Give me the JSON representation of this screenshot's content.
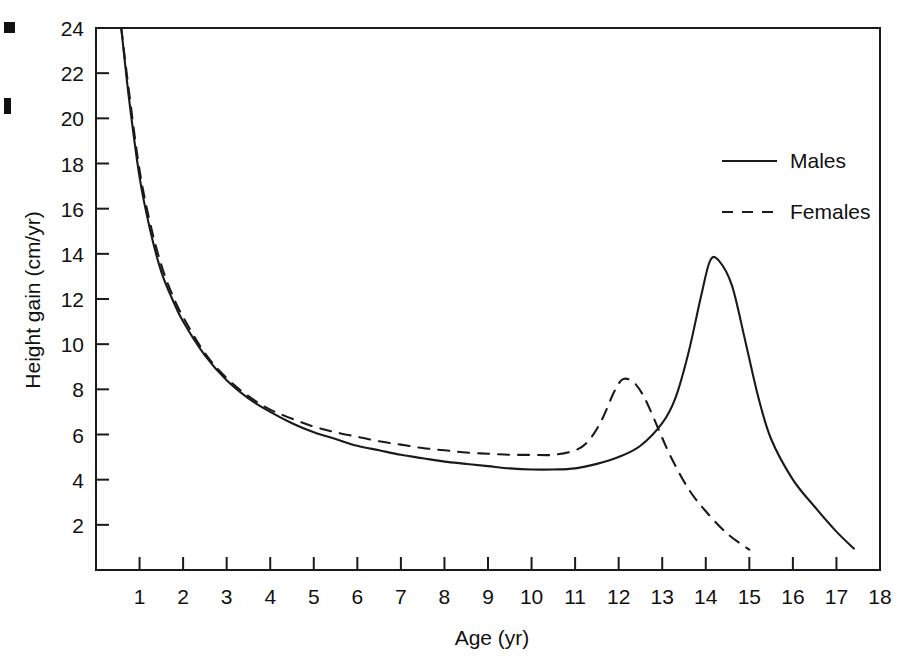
{
  "chart_data": {
    "type": "line",
    "title": "",
    "xlabel": "Age (yr)",
    "ylabel": "Height gain (cm/yr)",
    "xlim": [
      0,
      18
    ],
    "ylim": [
      0,
      24
    ],
    "grid": false,
    "legend_position": "top-right",
    "x_ticks": [
      "1",
      "2",
      "3",
      "4",
      "5",
      "6",
      "7",
      "8",
      "9",
      "10",
      "11",
      "12",
      "13",
      "14",
      "15",
      "16",
      "17",
      "18"
    ],
    "x_tick_values": [
      1,
      2,
      3,
      4,
      5,
      6,
      7,
      8,
      9,
      10,
      11,
      12,
      13,
      14,
      15,
      16,
      17,
      18
    ],
    "y_ticks": [
      "2",
      "4",
      "6",
      "8",
      "10",
      "12",
      "14",
      "16",
      "18",
      "20",
      "22",
      "24"
    ],
    "y_tick_values": [
      2,
      4,
      6,
      8,
      10,
      12,
      14,
      16,
      18,
      20,
      22,
      24
    ],
    "series": [
      {
        "name": "Males",
        "style": "solid",
        "color": "#1a1a1a",
        "x": [
          0.58,
          0.75,
          1.0,
          1.25,
          1.5,
          1.75,
          2.0,
          2.5,
          3.0,
          3.5,
          4.0,
          4.5,
          5.0,
          5.5,
          6.0,
          6.5,
          7.0,
          7.5,
          8.0,
          8.5,
          9.0,
          9.5,
          10.0,
          10.5,
          11.0,
          11.5,
          12.0,
          12.5,
          13.0,
          13.3,
          13.6,
          13.9,
          14.1,
          14.3,
          14.6,
          14.9,
          15.2,
          15.5,
          16.0,
          16.5,
          17.0,
          17.4
        ],
        "y": [
          24.0,
          21.0,
          17.4,
          15.0,
          13.2,
          12.0,
          11.0,
          9.5,
          8.4,
          7.6,
          7.0,
          6.5,
          6.1,
          5.8,
          5.5,
          5.3,
          5.1,
          4.95,
          4.8,
          4.7,
          4.6,
          4.5,
          4.45,
          4.45,
          4.5,
          4.7,
          5.0,
          5.5,
          6.5,
          7.6,
          9.6,
          12.2,
          13.7,
          13.7,
          12.6,
          10.2,
          7.7,
          5.8,
          4.0,
          2.8,
          1.7,
          0.95
        ]
      },
      {
        "name": "Females",
        "style": "dashed",
        "color": "#1a1a1a",
        "x": [
          0.58,
          0.75,
          1.0,
          1.25,
          1.5,
          1.75,
          2.0,
          2.5,
          3.0,
          3.5,
          4.0,
          4.5,
          5.0,
          5.5,
          6.0,
          6.5,
          7.0,
          7.5,
          8.0,
          8.5,
          9.0,
          9.5,
          10.0,
          10.5,
          11.0,
          11.3,
          11.6,
          11.9,
          12.1,
          12.35,
          12.6,
          12.9,
          13.2,
          13.6,
          14.0,
          14.5,
          15.0
        ],
        "y": [
          24.0,
          21.3,
          17.7,
          15.3,
          13.5,
          12.2,
          11.2,
          9.6,
          8.5,
          7.7,
          7.1,
          6.7,
          6.35,
          6.1,
          5.9,
          5.7,
          5.55,
          5.4,
          5.3,
          5.2,
          5.15,
          5.1,
          5.1,
          5.1,
          5.3,
          5.7,
          6.6,
          7.9,
          8.45,
          8.3,
          7.6,
          6.3,
          5.0,
          3.6,
          2.6,
          1.6,
          0.9
        ]
      }
    ],
    "legend": [
      {
        "label": "Males",
        "style": "solid"
      },
      {
        "label": "Females",
        "style": "dashed"
      }
    ]
  }
}
